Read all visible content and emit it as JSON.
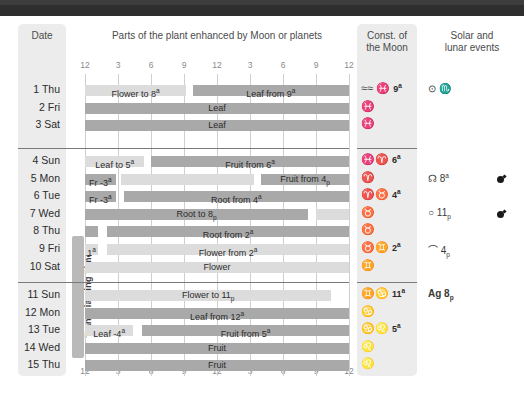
{
  "headers": {
    "date": "Date",
    "plant_parts": "Parts of the plant enhanced by Moon or planets",
    "constellation": "Const. of\nthe Moon",
    "constellation_l1": "Const. of",
    "constellation_l2": "the Moon",
    "events_l1": "Solar and",
    "events_l2": "lunar events"
  },
  "axis": {
    "ticks": [
      "12",
      "3",
      "6",
      "9",
      "12",
      "3",
      "6",
      "9",
      "12"
    ],
    "hours": [
      0,
      3,
      6,
      9,
      12,
      15,
      18,
      21,
      24
    ],
    "range": [
      0,
      24
    ]
  },
  "transplanting_label": "Transplanting Time",
  "colors": {
    "bar_light": "#dcdcdc",
    "bar_dark": "#a9a9a9",
    "panel": "#ececec",
    "banner": "#2e2e2e",
    "grid": "#cfcfcf"
  },
  "blocks": [
    {
      "rows": [
        {
          "date": "1 Thu",
          "segments": [
            {
              "start": 0,
              "end": 9.2,
              "shade": "light",
              "label": "Flower to 8",
              "sup": "a"
            },
            {
              "start": 9.8,
              "end": 24,
              "shade": "dark",
              "label": "Leaf from 9",
              "sup": "a"
            }
          ],
          "constellation": "≈≈ ♓",
          "const_symbols": [
            "aquarius",
            "pisces"
          ],
          "const_num": "9",
          "const_num_sup": "a",
          "event": "⊙ ♏",
          "event_bold": false,
          "moon": false
        },
        {
          "date": "2 Fri",
          "segments": [
            {
              "start": 0,
              "end": 24,
              "shade": "dark",
              "label": "Leaf",
              "sup": ""
            }
          ],
          "constellation": "♓",
          "const_symbols": [
            "pisces"
          ],
          "const_num": "",
          "const_num_sup": "",
          "event": "",
          "moon": false
        },
        {
          "date": "3 Sat",
          "segments": [
            {
              "start": 0,
              "end": 24,
              "shade": "dark",
              "label": "Leaf",
              "sup": ""
            }
          ],
          "constellation": "♓",
          "const_symbols": [
            "pisces"
          ],
          "const_num": "",
          "const_num_sup": "",
          "event": "",
          "moon": false
        }
      ]
    },
    {
      "rows": [
        {
          "date": "4 Sun",
          "segments": [
            {
              "start": 0,
              "end": 5.4,
              "shade": "light",
              "label": "Leaf to 5",
              "sup": "a"
            },
            {
              "start": 6.0,
              "end": 24,
              "shade": "dark",
              "label": "Fruit from 6",
              "sup": "a"
            }
          ],
          "constellation": "♓♈",
          "const_symbols": [
            "pisces",
            "aries"
          ],
          "const_num": "6",
          "const_num_sup": "a",
          "event": "",
          "moon": false
        },
        {
          "date": "5 Mon",
          "segments": [
            {
              "start": 0,
              "end": 2.8,
              "shade": "dark",
              "label": "Fr -3",
              "sup": "a"
            },
            {
              "start": 3.3,
              "end": 15.4,
              "shade": "light",
              "label": "",
              "sup": ""
            },
            {
              "start": 16.0,
              "end": 24,
              "shade": "dark",
              "label": "Fruit from 4",
              "sub": "p"
            }
          ],
          "constellation": "♈",
          "const_symbols": [
            "aries"
          ],
          "const_num": "",
          "const_num_sup": "",
          "event": "☊ 8",
          "event_sup": "a",
          "moon": true
        },
        {
          "date": "6 Tue",
          "segments": [
            {
              "start": 0,
              "end": 2.8,
              "shade": "dark",
              "label": "Fr -3",
              "sup": "a"
            },
            {
              "start": 3.5,
              "end": 24,
              "shade": "dark",
              "label": "Root from 4",
              "sup": "a"
            }
          ],
          "constellation": "♈♉",
          "const_symbols": [
            "aries",
            "taurus"
          ],
          "const_num": "4",
          "const_num_sup": "a",
          "event": "",
          "moon": false
        },
        {
          "date": "7 Wed",
          "segments": [
            {
              "start": 0,
              "end": 20.3,
              "shade": "dark",
              "label": "Root to 8",
              "sub": "p"
            },
            {
              "start": 21.0,
              "end": 24,
              "shade": "light",
              "label": "",
              "sup": ""
            }
          ],
          "constellation": "♉",
          "const_symbols": [
            "taurus"
          ],
          "const_num": "",
          "const_num_sup": "",
          "event": "○ 11",
          "event_sub": "p",
          "moon": true
        },
        {
          "date": "8 Thu",
          "segments": [
            {
              "start": 0,
              "end": 1.2,
              "shade": "dark",
              "label": "",
              "sup": ""
            },
            {
              "start": 2.0,
              "end": 24,
              "shade": "dark",
              "label": "Root from 2",
              "sup": "a"
            }
          ],
          "constellation": "♉",
          "const_symbols": [
            "taurus"
          ],
          "const_num": "",
          "const_num_sup": "",
          "event": "",
          "moon": false
        },
        {
          "date": "9 Fri",
          "segments": [
            {
              "start": 0,
              "end": 1.2,
              "shade": "light",
              "label": "1",
              "sup": "a"
            },
            {
              "start": 2.0,
              "end": 24,
              "shade": "light",
              "label": "Flower from 2",
              "sup": "a"
            }
          ],
          "constellation": "♉♊",
          "const_symbols": [
            "taurus",
            "gemini"
          ],
          "const_num": "2",
          "const_num_sup": "a",
          "event": "⌒ 4",
          "event_sub": "p",
          "moon": false
        },
        {
          "date": "10 Sat",
          "segments": [
            {
              "start": 0,
              "end": 24,
              "shade": "light",
              "label": "Flower",
              "sup": ""
            }
          ],
          "constellation": "♊",
          "const_symbols": [
            "gemini"
          ],
          "const_num": "",
          "const_num_sup": "",
          "event": "",
          "moon": false
        }
      ]
    },
    {
      "rows": [
        {
          "date": "11 Sun",
          "segments": [
            {
              "start": 0,
              "end": 22.4,
              "shade": "light",
              "label": "Flower to 11",
              "sub": "p"
            }
          ],
          "constellation": "♊♋",
          "const_symbols": [
            "gemini",
            "cancer"
          ],
          "const_num": "11",
          "const_num_sup": "a",
          "event": "Ag 8",
          "event_sub": "p",
          "event_bold": true,
          "moon": false
        },
        {
          "date": "12 Mon",
          "segments": [
            {
              "start": 0,
              "end": 24,
              "shade": "dark",
              "label": "Leaf from 12",
              "sup": "a"
            }
          ],
          "constellation": "♋",
          "const_symbols": [
            "cancer"
          ],
          "const_num": "",
          "const_num_sup": "",
          "event": "",
          "moon": false
        },
        {
          "date": "13 Tue",
          "segments": [
            {
              "start": 0,
              "end": 4.4,
              "shade": "light",
              "label": "Leaf -4",
              "sup": "a"
            },
            {
              "start": 5.2,
              "end": 24,
              "shade": "dark",
              "label": "Fruit from 5",
              "sup": "a"
            }
          ],
          "constellation": "♋♌",
          "const_symbols": [
            "cancer",
            "leo"
          ],
          "const_num": "5",
          "const_num_sup": "a",
          "event": "",
          "moon": false
        },
        {
          "date": "14 Wed",
          "segments": [
            {
              "start": 0,
              "end": 24,
              "shade": "dark",
              "label": "Fruit",
              "sup": ""
            }
          ],
          "constellation": "♌",
          "const_symbols": [
            "leo"
          ],
          "const_num": "",
          "const_num_sup": "",
          "event": "",
          "moon": false
        },
        {
          "date": "15 Thu",
          "segments": [
            {
              "start": 0,
              "end": 24,
              "shade": "dark",
              "label": "Fruit",
              "sup": ""
            }
          ],
          "constellation": "♌",
          "const_symbols": [
            "leo"
          ],
          "const_num": "",
          "const_num_sup": "",
          "event": "",
          "moon": false
        }
      ]
    }
  ]
}
